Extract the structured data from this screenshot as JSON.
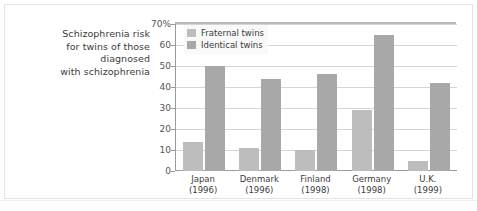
{
  "chart_data": {
    "type": "bar",
    "title": "Schizophrenia risk for twins of those diagnosed with schizophrenia",
    "title_lines": [
      "Schizophrenia risk",
      "for twins of those",
      "diagnosed",
      "with schizophrenia"
    ],
    "categories": [
      "Japan",
      "Denmark",
      "Finland",
      "Germany",
      "U.K."
    ],
    "category_years": [
      "(1996)",
      "(1996)",
      "(1998)",
      "(1998)",
      "(1999)"
    ],
    "category_labels": [
      [
        "Japan",
        "(1996)"
      ],
      [
        "Denmark",
        "(1996)"
      ],
      [
        "Finland",
        "(1998)"
      ],
      [
        "Germany",
        "(1998)"
      ],
      [
        "U.K.",
        "(1999)"
      ]
    ],
    "series": [
      {
        "name": "Fraternal twins",
        "color": "#bdbdbd",
        "values": [
          14,
          11,
          10,
          29,
          5
        ]
      },
      {
        "name": "Identical twins",
        "color": "#a8a8a8",
        "values": [
          50,
          44,
          46,
          65,
          42
        ]
      }
    ],
    "xlabel": "",
    "ylabel": "",
    "ylim": [
      0,
      70
    ],
    "ytick_values": [
      0,
      10,
      20,
      30,
      40,
      50,
      60,
      70
    ],
    "ytick_labels": [
      "0",
      "10",
      "20",
      "30",
      "40",
      "50",
      "60",
      "70%"
    ],
    "unit": "%",
    "grid": true,
    "legend_position": "top-left-inside"
  },
  "legend": {
    "items": [
      {
        "label": "Fraternal twins"
      },
      {
        "label": "Identical twins"
      }
    ]
  }
}
